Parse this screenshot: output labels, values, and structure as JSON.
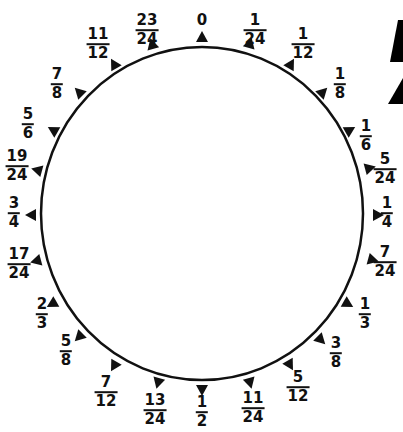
{
  "diagram": {
    "type": "fraction-circle",
    "circle": {
      "cx": 202,
      "cy": 213.5,
      "rx": 161,
      "ry": 166.5,
      "stroke": "#111111",
      "stroke_width": 2.5
    },
    "markers": [
      {
        "value": "0",
        "num": "0",
        "den": "",
        "mx": 202,
        "my": 37,
        "lx": 202,
        "ly": 20,
        "rot": 0
      },
      {
        "value": "1/24",
        "num": "1",
        "den": "24",
        "mx": 250,
        "my": 43,
        "lx": 255,
        "ly": 30,
        "rot": 15
      },
      {
        "value": "1/12",
        "num": "1",
        "den": "12",
        "mx": 291,
        "my": 64,
        "lx": 303,
        "ly": 44,
        "rot": 30
      },
      {
        "value": "1/8",
        "num": "1",
        "den": "8",
        "mx": 323,
        "my": 92,
        "lx": 340,
        "ly": 84,
        "rot": 45
      },
      {
        "value": "1/6",
        "num": "1",
        "den": "6",
        "mx": 350,
        "my": 130,
        "lx": 366,
        "ly": 136,
        "rot": 60
      },
      {
        "value": "5/24",
        "num": "5",
        "den": "24",
        "mx": 370,
        "my": 168,
        "lx": 385,
        "ly": 169,
        "rot": 75
      },
      {
        "value": "1/4",
        "num": "1",
        "den": "4",
        "mx": 378,
        "my": 215,
        "lx": 387,
        "ly": 213,
        "rot": 90
      },
      {
        "value": "7/24",
        "num": "7",
        "den": "24",
        "mx": 373,
        "my": 260,
        "lx": 385,
        "ly": 262,
        "rot": 105
      },
      {
        "value": "1/3",
        "num": "1",
        "den": "3",
        "mx": 348,
        "my": 304,
        "lx": 365,
        "ly": 314,
        "rot": 120
      },
      {
        "value": "3/8",
        "num": "3",
        "den": "8",
        "mx": 321,
        "my": 340,
        "lx": 336,
        "ly": 353,
        "rot": 135
      },
      {
        "value": "5/12",
        "num": "5",
        "den": "12",
        "mx": 290,
        "my": 365,
        "lx": 298,
        "ly": 387,
        "rot": 150
      },
      {
        "value": "11/24",
        "num": "11",
        "den": "24",
        "mx": 250,
        "my": 383,
        "lx": 253,
        "ly": 408,
        "rot": 165
      },
      {
        "value": "1/2",
        "num": "1",
        "den": "2",
        "mx": 202,
        "my": 390,
        "lx": 202,
        "ly": 412,
        "rot": 180
      },
      {
        "value": "13/24",
        "num": "13",
        "den": "24",
        "mx": 158,
        "my": 383,
        "lx": 155,
        "ly": 410,
        "rot": 195
      },
      {
        "value": "7/12",
        "num": "7",
        "den": "12",
        "mx": 114,
        "my": 366,
        "lx": 106,
        "ly": 392,
        "rot": 210
      },
      {
        "value": "5/8",
        "num": "5",
        "den": "8",
        "mx": 79,
        "my": 337,
        "lx": 66,
        "ly": 351,
        "rot": 225
      },
      {
        "value": "2/3",
        "num": "2",
        "den": "3",
        "mx": 52,
        "my": 304,
        "lx": 42,
        "ly": 314,
        "rot": 240
      },
      {
        "value": "17/24",
        "num": "17",
        "den": "24",
        "mx": 36,
        "my": 261,
        "lx": 19,
        "ly": 264,
        "rot": 255
      },
      {
        "value": "3/4",
        "num": "3",
        "den": "4",
        "mx": 31,
        "my": 215,
        "lx": 14,
        "ly": 213,
        "rot": 270
      },
      {
        "value": "19/24",
        "num": "19",
        "den": "24",
        "mx": 37,
        "my": 170,
        "lx": 17,
        "ly": 166,
        "rot": 285
      },
      {
        "value": "5/6",
        "num": "5",
        "den": "6",
        "mx": 53,
        "my": 130,
        "lx": 28,
        "ly": 124,
        "rot": 300
      },
      {
        "value": "7/8",
        "num": "7",
        "den": "8",
        "mx": 79,
        "my": 92,
        "lx": 57,
        "ly": 84,
        "rot": 315
      },
      {
        "value": "11/12",
        "num": "11",
        "den": "12",
        "mx": 114,
        "my": 64,
        "lx": 98,
        "ly": 44,
        "rot": 330
      },
      {
        "value": "23/24",
        "num": "23",
        "den": "24",
        "mx": 152,
        "my": 44,
        "lx": 147,
        "ly": 30,
        "rot": 345
      }
    ],
    "cropped_corner_shape": {
      "color": "#000000"
    }
  }
}
